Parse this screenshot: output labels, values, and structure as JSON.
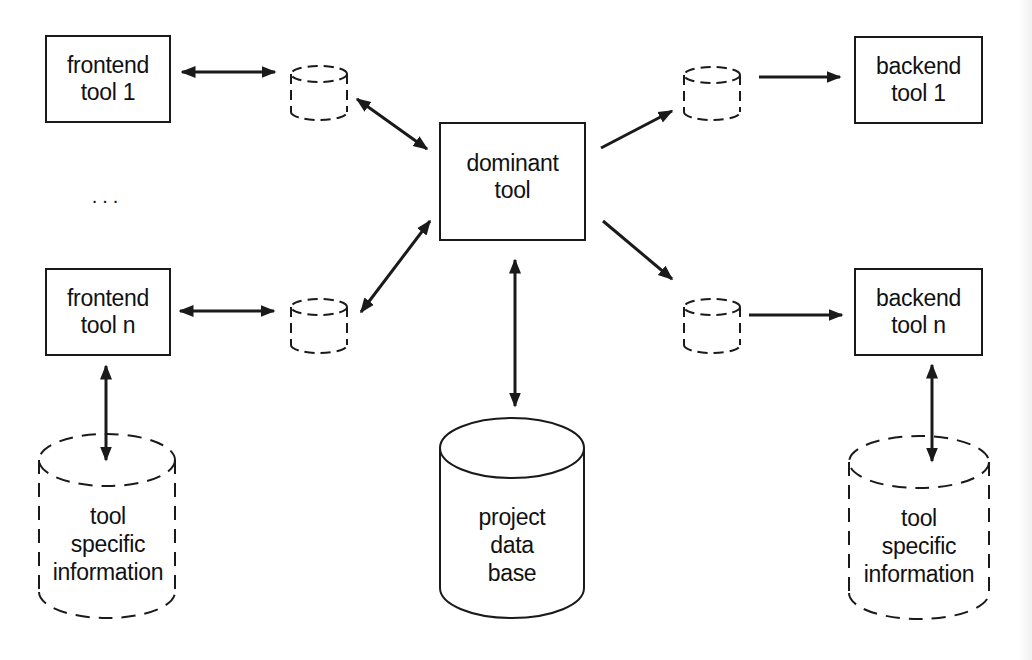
{
  "diagram": {
    "type": "tool-integration architecture",
    "nodes": {
      "frontend_tool_1": {
        "line1": "frontend",
        "line2": "tool 1",
        "shape": "rectangle"
      },
      "ellipsis": {
        "text": ". . ."
      },
      "frontend_tool_n": {
        "line1": "frontend",
        "line2": "tool n",
        "shape": "rectangle"
      },
      "dominant_tool": {
        "line1": "dominant",
        "line2": "tool",
        "shape": "rectangle"
      },
      "backend_tool_1": {
        "line1": "backend",
        "line2": "tool 1",
        "shape": "rectangle"
      },
      "backend_tool_n": {
        "line1": "backend",
        "line2": "tool n",
        "shape": "rectangle"
      },
      "project_db": {
        "line1": "project",
        "line2": "data",
        "line3": "base",
        "shape": "cylinder-solid"
      },
      "tool_info_left": {
        "line1": "tool",
        "line2": "specific",
        "line3": "information",
        "shape": "cylinder-dashed"
      },
      "tool_info_right": {
        "line1": "tool",
        "line2": "specific",
        "line3": "information",
        "shape": "cylinder-dashed"
      },
      "buffers": [
        {
          "id": "buffer-frontend-1",
          "shape": "cylinder-dashed-small"
        },
        {
          "id": "buffer-frontend-n",
          "shape": "cylinder-dashed-small"
        },
        {
          "id": "buffer-backend-1",
          "shape": "cylinder-dashed-small"
        },
        {
          "id": "buffer-backend-n",
          "shape": "cylinder-dashed-small"
        }
      ]
    },
    "edges": [
      {
        "from": "frontend_tool_1",
        "to": "buffer-frontend-1",
        "direction": "both"
      },
      {
        "from": "buffer-frontend-1",
        "to": "dominant_tool",
        "direction": "both"
      },
      {
        "from": "frontend_tool_n",
        "to": "buffer-frontend-n",
        "direction": "both"
      },
      {
        "from": "buffer-frontend-n",
        "to": "dominant_tool",
        "direction": "both"
      },
      {
        "from": "dominant_tool",
        "to": "buffer-backend-1",
        "direction": "forward"
      },
      {
        "from": "buffer-backend-1",
        "to": "backend_tool_1",
        "direction": "forward"
      },
      {
        "from": "dominant_tool",
        "to": "buffer-backend-n",
        "direction": "forward"
      },
      {
        "from": "buffer-backend-n",
        "to": "backend_tool_n",
        "direction": "forward"
      },
      {
        "from": "dominant_tool",
        "to": "project_db",
        "direction": "both"
      },
      {
        "from": "frontend_tool_n",
        "to": "tool_info_left",
        "direction": "both"
      },
      {
        "from": "backend_tool_n",
        "to": "tool_info_right",
        "direction": "both"
      }
    ],
    "colors": {
      "stroke": "#1a1a1a",
      "background": "#ffffff"
    }
  }
}
